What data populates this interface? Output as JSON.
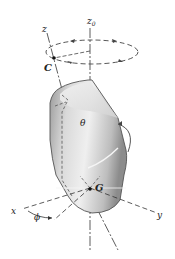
{
  "diagram": {
    "labels": {
      "z0": "z",
      "z0_sub": "0",
      "z": "z",
      "C": "C",
      "theta": "θ",
      "G": "G",
      "x": "x",
      "y": "y",
      "phi": "ϕ"
    },
    "colors": {
      "line": "#333333",
      "body_light": "#e6e6e6",
      "body_mid": "#c4c4c4",
      "body_dark": "#8f8f8f",
      "background": "#ffffff"
    }
  }
}
